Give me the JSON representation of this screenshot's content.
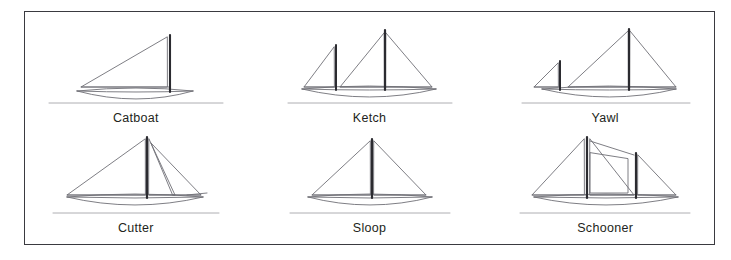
{
  "figure": {
    "kind": "line-drawing-plate",
    "title": "",
    "border_color": "#3a3a40",
    "background_color": "#ffffff",
    "ink_color": "#6f6f76",
    "mast_color": "#2b2b30",
    "label_color": "#231f20",
    "columns": 3,
    "rows": 2
  },
  "boats": [
    {
      "id": "catboat",
      "label": "Catboat",
      "row": 1,
      "column": 1,
      "mast_count": 1,
      "sail_count": 1,
      "sails": [
        "mainsail"
      ],
      "description": "Single mast set well aft with one large triangular mainsail forward of the mast."
    },
    {
      "id": "ketch",
      "label": "Ketch",
      "row": 1,
      "column": 2,
      "mast_count": 2,
      "sail_count": 3,
      "sails": [
        "mizzen",
        "mainsail",
        "jib"
      ],
      "description": "Tall mainmast amidships with jib aft and a shorter mizzen mast forward in this view."
    },
    {
      "id": "yawl",
      "label": "Yawl",
      "row": 1,
      "column": 3,
      "mast_count": 2,
      "sail_count": 3,
      "sails": [
        "mizzen",
        "mainsail",
        "jib"
      ],
      "description": "Tall mainmast with jib aft and a very small mizzen set at the far end of the hull."
    },
    {
      "id": "cutter",
      "label": "Cutter",
      "row": 2,
      "column": 1,
      "mast_count": 1,
      "sail_count": 3,
      "sails": [
        "mainsail",
        "staysail",
        "jib"
      ],
      "description": "Single mast with one large mainsail and two headsails, a staysail and a jib."
    },
    {
      "id": "sloop",
      "label": "Sloop",
      "row": 2,
      "column": 2,
      "mast_count": 1,
      "sail_count": 2,
      "sails": [
        "mainsail",
        "jib"
      ],
      "description": "Single mast carrying one mainsail and a single headsail."
    },
    {
      "id": "schooner",
      "label": "Schooner",
      "row": 2,
      "column": 3,
      "mast_count": 2,
      "sail_count": 4,
      "sails": [
        "foresail",
        "main-staysail",
        "mainsail",
        "aft-sail"
      ],
      "description": "Two masts of similar height carrying four sails including a staysail between the masts."
    }
  ]
}
